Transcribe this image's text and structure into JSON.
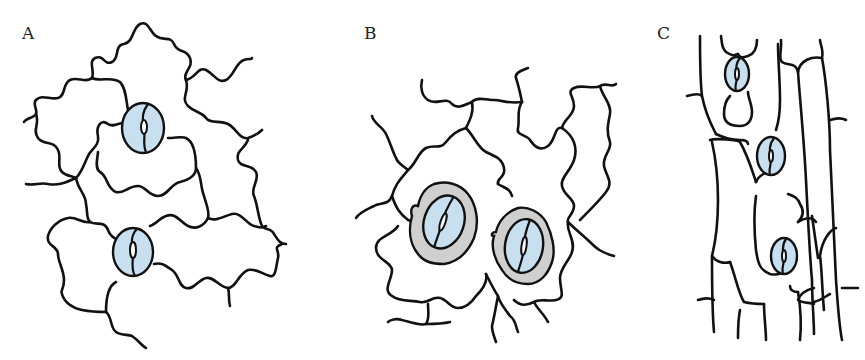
{
  "figure": {
    "panels": [
      {
        "id": "A",
        "label": "A",
        "description": "Epidermis with wavy anticlinal walls and two kidney-shaped stomata without subsidiary cells"
      },
      {
        "id": "B",
        "label": "B",
        "description": "Epidermis with wavy walls and two stomata surrounded by gray subsidiary cells"
      },
      {
        "id": "C",
        "label": "C",
        "description": "Elongated rectangular epidermal cells with three stomata arranged in a row"
      }
    ],
    "colors": {
      "guard_cell": "#c8dff0",
      "subsidiary_cell": "#cfcfcf",
      "cell_wall": "#111111",
      "background": "#ffffff"
    }
  }
}
